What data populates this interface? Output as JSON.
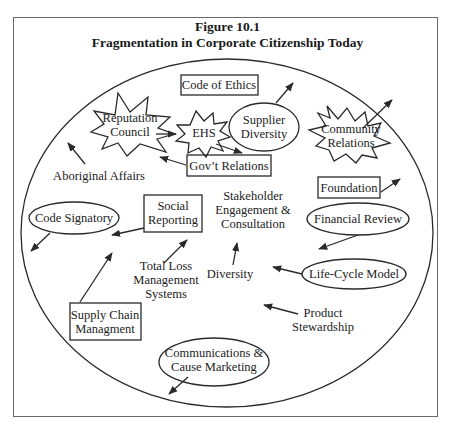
{
  "figure": {
    "number": "Figure 10.1",
    "title": "Fragmentation in Corporate Citizenship Today"
  },
  "nodes": {
    "code_of_ethics": {
      "label": "Code of Ethics",
      "shape": "box"
    },
    "reputation_council": {
      "line1": "Reputation",
      "line2": "Council",
      "shape": "star"
    },
    "ehs": {
      "label": "EHS",
      "shape": "star"
    },
    "supplier_diversity": {
      "line1": "Supplier",
      "line2": "Diversity",
      "shape": "ellipse"
    },
    "community_relations": {
      "line1": "Community",
      "line2": "Relations",
      "shape": "star"
    },
    "govt_relations": {
      "label": "Gov’t Relations",
      "shape": "box"
    },
    "aboriginal_affairs": {
      "label": "Aboriginal Affairs",
      "shape": "text"
    },
    "foundation": {
      "label": "Foundation",
      "shape": "box"
    },
    "code_signatory": {
      "label": "Code Signatory",
      "shape": "ellipse"
    },
    "social_reporting": {
      "line1": "Social",
      "line2": "Reporting",
      "shape": "box"
    },
    "stakeholder_engagement": {
      "line1": "Stakeholder",
      "line2": "Engagement &",
      "line3": "Consultation",
      "shape": "text"
    },
    "financial_review": {
      "label": "Financial Review",
      "shape": "ellipse"
    },
    "total_loss": {
      "line1": "Total Loss",
      "line2": "Management",
      "line3": "Systems",
      "shape": "text"
    },
    "diversity": {
      "label": "Diversity",
      "shape": "text"
    },
    "life_cycle_model": {
      "label": "Life-Cycle Model",
      "shape": "ellipse"
    },
    "supply_chain": {
      "line1": "Supply Chain",
      "line2": "Managment",
      "shape": "box"
    },
    "product_stewardship": {
      "line1": "Product",
      "line2": "Stewardship",
      "shape": "text"
    },
    "communications": {
      "line1": "Communications &",
      "line2": "Cause Marketing",
      "shape": "ellipse"
    }
  },
  "colors": {
    "stroke": "#2a2a2a",
    "frame": "#6a6a6a",
    "text": "#222222",
    "background": "#ffffff"
  }
}
